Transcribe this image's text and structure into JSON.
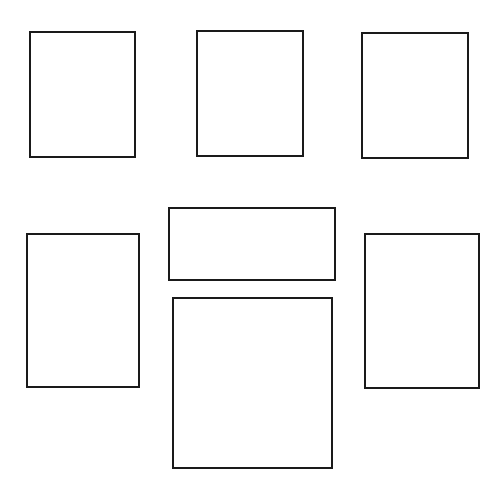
{
  "canvas": {
    "width": 502,
    "height": 488,
    "background": "#ffffff"
  },
  "stroke_color": "#1a1a1a",
  "boxes": [
    {
      "id": "top-left",
      "x": 29,
      "y": 31,
      "w": 107,
      "h": 127
    },
    {
      "id": "top-center",
      "x": 196,
      "y": 30,
      "w": 108,
      "h": 127
    },
    {
      "id": "top-right",
      "x": 361,
      "y": 32,
      "w": 108,
      "h": 127
    },
    {
      "id": "middle-left",
      "x": 26,
      "y": 233,
      "w": 114,
      "h": 155
    },
    {
      "id": "middle-center",
      "x": 168,
      "y": 207,
      "w": 168,
      "h": 74
    },
    {
      "id": "bottom-center",
      "x": 172,
      "y": 297,
      "w": 161,
      "h": 172
    },
    {
      "id": "middle-right",
      "x": 364,
      "y": 233,
      "w": 116,
      "h": 156
    }
  ]
}
